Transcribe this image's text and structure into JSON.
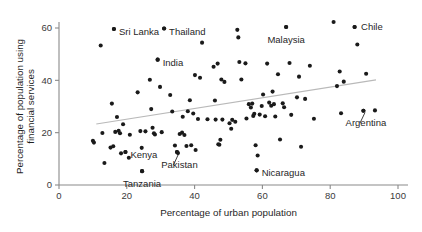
{
  "chart_data": {
    "type": "scatter",
    "title": "",
    "xlabel": "Percentage of urban population",
    "ylabel": "Percentage of population using financial services",
    "ylabel_line1": "Percentage of population using",
    "ylabel_line2": "financial services",
    "xlim": [
      0,
      103
    ],
    "ylim": [
      0,
      64
    ],
    "xticks": [
      0,
      20,
      40,
      60,
      80,
      100
    ],
    "yticks": [
      0,
      20,
      40,
      60
    ],
    "xtick_labels": [
      "0",
      "20",
      "40",
      "60",
      "80",
      "100"
    ],
    "ytick_labels": [
      "0",
      "20",
      "40",
      "60"
    ],
    "grid": false,
    "legend": false,
    "point_color": "#1a1a1a",
    "axis_color": "#8a8a8a",
    "trend_color": "#b9b9b9",
    "trendline": {
      "label": "linear fit",
      "x0": 11.0,
      "y0": 23.3,
      "x1": 93.5,
      "y1": 40.2
    },
    "annotations": [
      {
        "label": "Sri Lanka",
        "x": 16.2,
        "y": 59.6,
        "label_dx": 5,
        "label_dy": 3.2,
        "anchor": "start",
        "leader": false
      },
      {
        "label": "Thailand",
        "x": 31.0,
        "y": 59.8,
        "label_dx": 5,
        "label_dy": 3.2,
        "anchor": "start",
        "leader": false
      },
      {
        "label": "India",
        "x": 29.1,
        "y": 47.9,
        "label_dx": 5,
        "label_dy": 3.2,
        "anchor": "start",
        "leader": false
      },
      {
        "label": "Malaysia",
        "x": 67.0,
        "y": 60.4,
        "label_dx": 0,
        "label_dy": -6.5,
        "anchor": "middle",
        "leader": false
      },
      {
        "label": "Chile",
        "x": 87.2,
        "y": 60.4,
        "label_dx": 6.5,
        "label_dy": 6.5,
        "anchor": "start",
        "leader": false
      },
      {
        "label": "Kenya",
        "x": 19.6,
        "y": 12.6,
        "label_dx": 5,
        "label_dy": 3.2,
        "anchor": "start",
        "leader": false
      },
      {
        "label": "Tanzania",
        "x": 24.5,
        "y": 5.3,
        "label_dx": 0,
        "label_dy": -6.5,
        "anchor": "middle",
        "leader": false
      },
      {
        "label": "Pakistan",
        "x": 34.8,
        "y": 12.6,
        "label_dx": 2.5,
        "label_dy": -7.0,
        "anchor": "middle",
        "leader": true
      },
      {
        "label": "Nicaragua",
        "x": 58.3,
        "y": 5.6,
        "label_dx": 5,
        "label_dy": 3.2,
        "anchor": "start",
        "leader": false
      },
      {
        "label": "Argentina",
        "x": 89.8,
        "y": 28.4,
        "label_dx": 2.5,
        "label_dy": -6.5,
        "anchor": "middle",
        "leader": true
      }
    ],
    "points": [
      {
        "x": 10.0,
        "y": 16.9
      },
      {
        "x": 10.3,
        "y": 16.2
      },
      {
        "x": 12.3,
        "y": 53.3
      },
      {
        "x": 12.8,
        "y": 19.9
      },
      {
        "x": 13.4,
        "y": 8.4
      },
      {
        "x": 15.2,
        "y": 14.3
      },
      {
        "x": 15.6,
        "y": 31.1
      },
      {
        "x": 16.0,
        "y": 14.8
      },
      {
        "x": 16.2,
        "y": 59.6
      },
      {
        "x": 16.6,
        "y": 20.3
      },
      {
        "x": 17.1,
        "y": 26.0
      },
      {
        "x": 17.6,
        "y": 20.7
      },
      {
        "x": 18.0,
        "y": 19.8
      },
      {
        "x": 18.3,
        "y": 12.1
      },
      {
        "x": 18.9,
        "y": 23.2
      },
      {
        "x": 19.6,
        "y": 12.6
      },
      {
        "x": 20.6,
        "y": 10.4
      },
      {
        "x": 20.9,
        "y": 19.2
      },
      {
        "x": 23.2,
        "y": 35.4
      },
      {
        "x": 24.0,
        "y": 20.6
      },
      {
        "x": 24.4,
        "y": 14.2
      },
      {
        "x": 24.5,
        "y": 5.3
      },
      {
        "x": 25.5,
        "y": 20.5
      },
      {
        "x": 26.8,
        "y": 40.2
      },
      {
        "x": 27.2,
        "y": 29.0
      },
      {
        "x": 27.6,
        "y": 21.9
      },
      {
        "x": 28.0,
        "y": 19.8
      },
      {
        "x": 28.3,
        "y": 19.3
      },
      {
        "x": 29.1,
        "y": 47.9
      },
      {
        "x": 29.8,
        "y": 37.5
      },
      {
        "x": 30.3,
        "y": 20.2
      },
      {
        "x": 31.0,
        "y": 59.8
      },
      {
        "x": 32.8,
        "y": 34.4
      },
      {
        "x": 33.4,
        "y": 28.1
      },
      {
        "x": 34.2,
        "y": 15.1
      },
      {
        "x": 34.8,
        "y": 12.6
      },
      {
        "x": 35.1,
        "y": 12.2
      },
      {
        "x": 35.6,
        "y": 19.5
      },
      {
        "x": 36.3,
        "y": 20.0
      },
      {
        "x": 36.5,
        "y": 26.1
      },
      {
        "x": 37.0,
        "y": 19.1
      },
      {
        "x": 37.6,
        "y": 14.9
      },
      {
        "x": 38.0,
        "y": 28.2
      },
      {
        "x": 38.6,
        "y": 32.4
      },
      {
        "x": 39.0,
        "y": 15.2
      },
      {
        "x": 39.6,
        "y": 27.3
      },
      {
        "x": 40.1,
        "y": 42.0
      },
      {
        "x": 40.3,
        "y": 13.4
      },
      {
        "x": 41.0,
        "y": 25.2
      },
      {
        "x": 41.6,
        "y": 41.0
      },
      {
        "x": 42.2,
        "y": 54.4
      },
      {
        "x": 43.8,
        "y": 25.1
      },
      {
        "x": 45.6,
        "y": 45.2
      },
      {
        "x": 46.0,
        "y": 32.3
      },
      {
        "x": 46.2,
        "y": 25.0
      },
      {
        "x": 46.8,
        "y": 46.4
      },
      {
        "x": 47.0,
        "y": 15.6
      },
      {
        "x": 47.3,
        "y": 15.4
      },
      {
        "x": 47.6,
        "y": 17.3
      },
      {
        "x": 47.9,
        "y": 40.3
      },
      {
        "x": 48.2,
        "y": 25.0
      },
      {
        "x": 48.8,
        "y": 39.4
      },
      {
        "x": 50.3,
        "y": 23.6
      },
      {
        "x": 50.8,
        "y": 21.5
      },
      {
        "x": 51.1,
        "y": 24.9
      },
      {
        "x": 52.0,
        "y": 24.2
      },
      {
        "x": 52.6,
        "y": 59.3
      },
      {
        "x": 52.9,
        "y": 56.4
      },
      {
        "x": 53.2,
        "y": 47.0
      },
      {
        "x": 53.8,
        "y": 40.3
      },
      {
        "x": 55.0,
        "y": 46.5
      },
      {
        "x": 55.3,
        "y": 25.4
      },
      {
        "x": 56.0,
        "y": 30.9
      },
      {
        "x": 56.6,
        "y": 29.6
      },
      {
        "x": 57.0,
        "y": 31.1
      },
      {
        "x": 57.3,
        "y": 26.4
      },
      {
        "x": 57.6,
        "y": 27.2
      },
      {
        "x": 58.0,
        "y": 15.2
      },
      {
        "x": 58.3,
        "y": 5.6
      },
      {
        "x": 58.6,
        "y": 11.3
      },
      {
        "x": 59.2,
        "y": 26.9
      },
      {
        "x": 59.8,
        "y": 30.2
      },
      {
        "x": 60.2,
        "y": 34.6
      },
      {
        "x": 60.8,
        "y": 26.3
      },
      {
        "x": 61.4,
        "y": 46.4
      },
      {
        "x": 62.0,
        "y": 31.5
      },
      {
        "x": 62.6,
        "y": 30.3
      },
      {
        "x": 63.0,
        "y": 35.7
      },
      {
        "x": 63.4,
        "y": 30.9
      },
      {
        "x": 63.8,
        "y": 26.2
      },
      {
        "x": 64.6,
        "y": 42.3
      },
      {
        "x": 65.2,
        "y": 17.4
      },
      {
        "x": 66.0,
        "y": 31.2
      },
      {
        "x": 66.4,
        "y": 29.7
      },
      {
        "x": 67.0,
        "y": 60.4
      },
      {
        "x": 68.0,
        "y": 46.6
      },
      {
        "x": 68.5,
        "y": 26.8
      },
      {
        "x": 70.2,
        "y": 33.5
      },
      {
        "x": 70.8,
        "y": 41.4
      },
      {
        "x": 71.4,
        "y": 14.6
      },
      {
        "x": 72.6,
        "y": 32.9
      },
      {
        "x": 74.0,
        "y": 45.6
      },
      {
        "x": 75.2,
        "y": 25.3
      },
      {
        "x": 81.0,
        "y": 62.3
      },
      {
        "x": 82.0,
        "y": 37.8
      },
      {
        "x": 82.8,
        "y": 43.4
      },
      {
        "x": 83.2,
        "y": 27.4
      },
      {
        "x": 84.0,
        "y": 39.5
      },
      {
        "x": 87.2,
        "y": 60.4
      },
      {
        "x": 88.0,
        "y": 53.7
      },
      {
        "x": 89.8,
        "y": 28.4
      },
      {
        "x": 90.6,
        "y": 42.5
      },
      {
        "x": 93.2,
        "y": 28.5
      }
    ]
  }
}
